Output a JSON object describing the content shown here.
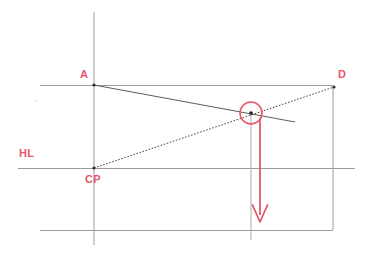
{
  "diagram": {
    "labels": {
      "a": "A",
      "d": "D",
      "hl": "HL",
      "cp": "CP"
    },
    "colors": {
      "accent_red": "#e8566a",
      "line_gray": "#8f8f8f",
      "construction_dark": "#3a3a3a",
      "background": "#ffffff"
    },
    "points": {
      "A": {
        "x": 94,
        "y": 85
      },
      "D": {
        "x": 334,
        "y": 87
      },
      "CP": {
        "x": 94,
        "y": 168
      },
      "intersection": {
        "x": 251,
        "y": 113
      }
    },
    "guides": {
      "vertical_left": {
        "x": 94,
        "y1": 12,
        "y2": 245
      },
      "vertical_right": {
        "x": 333,
        "y1": 87,
        "y2": 230
      },
      "top_horizontal": {
        "y": 85,
        "x1": 40,
        "x2": 333
      },
      "horizon_line": {
        "y": 168,
        "x1": 18,
        "x2": 355
      },
      "bottom_horizontal": {
        "y": 230,
        "x1": 40,
        "x2": 333
      },
      "drop_line": {
        "x": 251,
        "y1": 113,
        "y2": 240
      }
    },
    "construction_lines": [
      {
        "name": "line-A-to-right",
        "x1": 94,
        "y1": 85,
        "x2": 295,
        "y2": 122,
        "style": "solid"
      },
      {
        "name": "line-CP-to-D",
        "x1": 94,
        "y1": 168,
        "x2": 334,
        "y2": 87,
        "style": "dotted"
      }
    ],
    "marker_circle": {
      "cx": 251,
      "cy": 113,
      "r": 11
    },
    "force_arrow": {
      "x": 260,
      "y1": 118,
      "y2": 222,
      "direction": "down"
    }
  }
}
